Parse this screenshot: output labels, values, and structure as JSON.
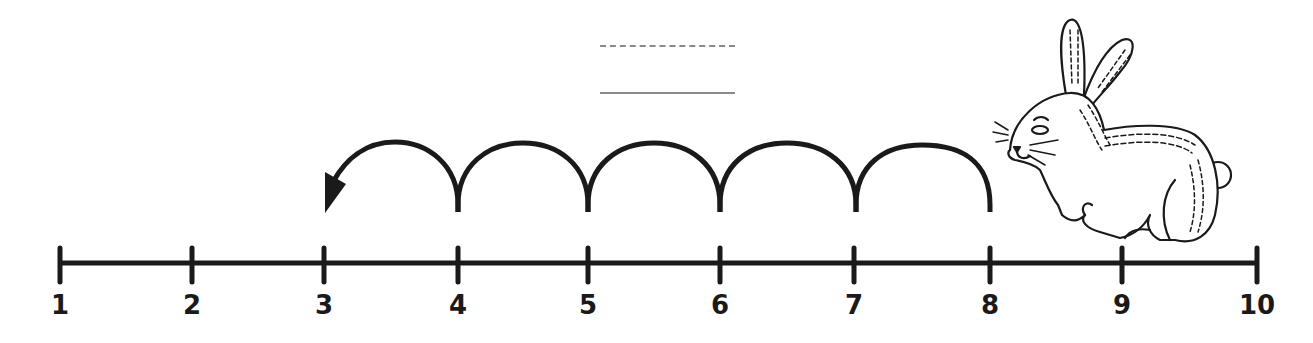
{
  "problem": {
    "answer_blanks": [
      {
        "style": "dashed",
        "value": ""
      },
      {
        "style": "solid",
        "value": ""
      }
    ]
  },
  "number_line": {
    "labels": [
      "1",
      "2",
      "3",
      "4",
      "5",
      "6",
      "7",
      "8",
      "9",
      "10"
    ],
    "start": 1,
    "end": 10,
    "color": "#1a1a1a"
  },
  "jumps": {
    "from": 8,
    "to": 3,
    "count": 5,
    "direction": "left",
    "color": "#1a1a1a"
  },
  "illustration": {
    "animal": "rabbit",
    "position": "above 8-9"
  }
}
